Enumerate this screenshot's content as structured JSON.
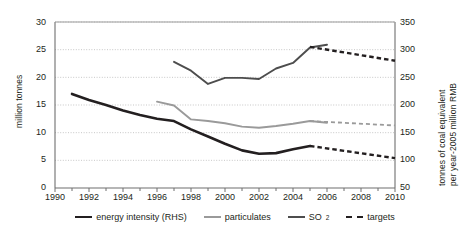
{
  "chart_data": {
    "type": "line",
    "title": "",
    "xlabel": "",
    "ylabel": "million tonnes",
    "ylabel_right_line1": "tonnes of coal equivalent",
    "ylabel_right_line2": "per year-2005 million RMB",
    "xlim": [
      1990,
      2010
    ],
    "ylim": [
      0,
      30
    ],
    "ylim_right": [
      50,
      350
    ],
    "yticks": [
      0,
      5,
      10,
      15,
      20,
      25,
      30
    ],
    "yticks_right": [
      50,
      100,
      150,
      200,
      250,
      300,
      350
    ],
    "xticks": [
      1990,
      1991,
      1992,
      1993,
      1994,
      1995,
      1996,
      1997,
      1998,
      1999,
      2000,
      2001,
      2002,
      2003,
      2004,
      2005,
      2006,
      2007,
      2008,
      2009,
      2010
    ],
    "xtick_labels": [
      "1990",
      "1992",
      "1994",
      "1996",
      "1998",
      "2000",
      "2002",
      "2004",
      "2006",
      "2008",
      "2010"
    ],
    "xtick_label_years": [
      1990,
      1992,
      1994,
      1996,
      1998,
      2000,
      2002,
      2004,
      2006,
      2008,
      2010
    ],
    "grid": true,
    "grid_style": "dotted-horizontal",
    "legend_position": "bottom",
    "series": [
      {
        "name": "energy intensity (RHS)",
        "axis": "right",
        "style": "solid",
        "color": "#231f20",
        "x": [
          1991,
          1992,
          1993,
          1994,
          1995,
          1996,
          1997,
          1998,
          1999,
          2000,
          2001,
          2002,
          2003,
          2004,
          2005
        ],
        "values_left_scale": [
          17.0,
          15.9,
          15.0,
          14.0,
          13.2,
          12.5,
          12.1,
          10.6,
          9.3,
          8.0,
          6.8,
          6.2,
          6.3,
          7.0,
          7.6
        ],
        "values": [
          210,
          202,
          196,
          189,
          183,
          178,
          175,
          164,
          155,
          145,
          136,
          131,
          132,
          138,
          143
        ]
      },
      {
        "name": "particulates",
        "axis": "left",
        "style": "solid",
        "color": "#9a9a9a",
        "x": [
          1996,
          1997,
          1998,
          1999,
          2000,
          2001,
          2002,
          2003,
          2004,
          2005,
          2006
        ],
        "values": [
          15.6,
          14.9,
          12.4,
          12.1,
          11.7,
          11.1,
          10.9,
          11.2,
          11.6,
          12.1,
          11.8
        ]
      },
      {
        "name": "SO2",
        "label": "SO",
        "subscript": "2",
        "axis": "left",
        "style": "solid",
        "color": "#4d4d4d",
        "x": [
          1997,
          1998,
          1999,
          2000,
          2001,
          2002,
          2003,
          2004,
          2005,
          2006
        ],
        "values": [
          22.8,
          21.2,
          18.8,
          19.9,
          19.9,
          19.7,
          21.6,
          22.6,
          25.4,
          25.9
        ]
      },
      {
        "name": "targets",
        "style": "dashed",
        "color": "#231f20",
        "segments": [
          {
            "for": "SO2",
            "axis": "left",
            "x": [
              2005,
              2010
            ],
            "values": [
              25.5,
              23.0
            ]
          },
          {
            "for": "particulates",
            "axis": "left",
            "color": "#9a9a9a",
            "x": [
              2005,
              2010
            ],
            "values": [
              12.1,
              11.3
            ]
          },
          {
            "for": "energy intensity (RHS)",
            "axis": "right",
            "x": [
              2005,
              2010
            ],
            "values_left_scale": [
              7.6,
              5.4
            ],
            "values": [
              143,
              110
            ]
          }
        ]
      }
    ],
    "legend": [
      {
        "label": "energy intensity (RHS)",
        "style": "solid",
        "color": "#231f20"
      },
      {
        "label": "particulates",
        "style": "solid",
        "color": "#9a9a9a"
      },
      {
        "label": "SO",
        "subscript": "2",
        "style": "solid",
        "color": "#4d4d4d"
      },
      {
        "label": "targets",
        "style": "dashed",
        "color": "#231f20"
      }
    ]
  }
}
